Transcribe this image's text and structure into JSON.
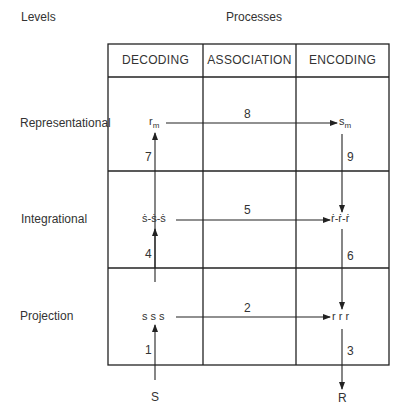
{
  "title_levels": "Levels",
  "title_processes": "Processes",
  "columns": [
    "DECODING",
    "ASSOCIATION",
    "ENCODING"
  ],
  "levels": [
    "Representational",
    "Integrational",
    "Projection"
  ],
  "nodes": {
    "decoding_representational": "rm",
    "encoding_representational": "sm",
    "decoding_integrational": "ṡ-ṡ-ṡ",
    "encoding_integrational": "ṙ-ṙ-ṙ",
    "decoding_projection": "s s s",
    "encoding_projection": "r r r",
    "stimulus": "S",
    "response": "R"
  },
  "node_subscripts": {
    "rm": "m",
    "sm": "m"
  },
  "arrow_labels": {
    "a1": "1",
    "a2": "2",
    "a3": "3",
    "a4": "4",
    "a5": "5",
    "a6": "6",
    "a7": "7",
    "a8": "8",
    "a9": "9"
  }
}
